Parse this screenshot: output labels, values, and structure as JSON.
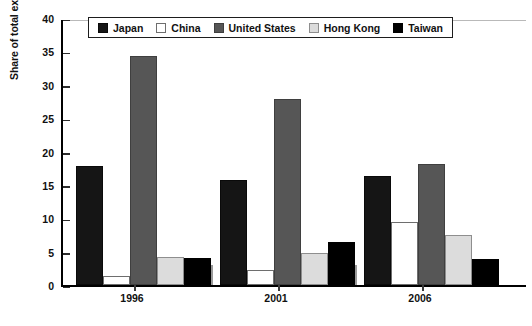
{
  "chart_data": {
    "type": "bar",
    "title": "",
    "xlabel": "",
    "ylabel": "Share of total exports (percent)",
    "categories": [
      "1996",
      "2001",
      "2006"
    ],
    "ylim": [
      0,
      40
    ],
    "ytick_step": 5,
    "yticks": [
      "40",
      "35",
      "30",
      "25",
      "20",
      "15",
      "10",
      "5",
      "0"
    ],
    "grid": false,
    "legend_position": "top-center",
    "series": [
      {
        "name": "Japan",
        "color": "#151515",
        "values": [
          17.8,
          15.7,
          16.4
        ]
      },
      {
        "name": "China",
        "color": "#ffffff",
        "values": [
          1.4,
          2.2,
          9.5
        ]
      },
      {
        "name": "United States",
        "color": "#565656",
        "values": [
          34.3,
          27.9,
          18.2
        ]
      },
      {
        "name": "Hong Kong",
        "color": "#dcdcdc",
        "values": [
          4.2,
          4.8,
          7.5
        ]
      },
      {
        "name": "Taiwan",
        "color": "#000000",
        "values": [
          4.0,
          6.4,
          3.9
        ]
      }
    ]
  }
}
